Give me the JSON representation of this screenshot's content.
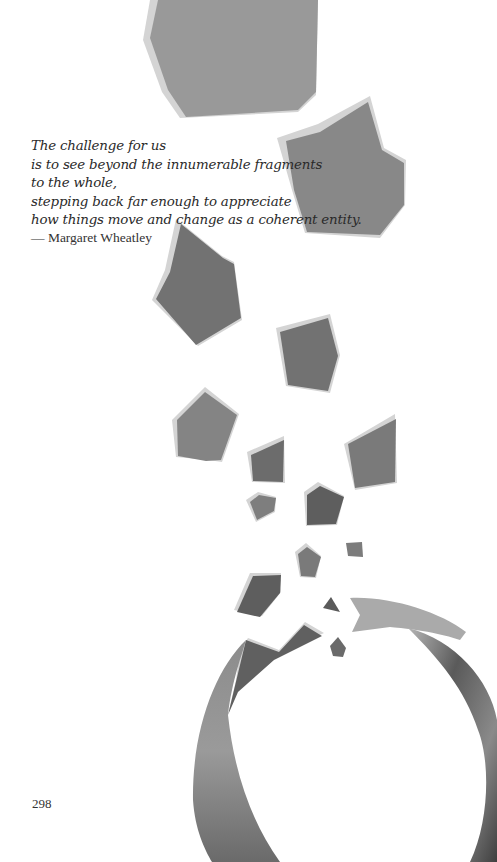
{
  "quote": {
    "lines": [
      "The challenge for us",
      "is to see beyond the innumerable fragments",
      "to the whole,",
      "stepping back far enough to appreciate",
      "how things move and change as a coherent entity."
    ],
    "attribution": "— Margaret Wheatley"
  },
  "page": {
    "number": "298"
  },
  "illustration": {
    "description": "watercolor fragments scattering from a broken ring",
    "colors": {
      "fragment_light": "#9a9a9a",
      "fragment_mid": "#7b7b7b",
      "fragment_dark": "#5f5f5f",
      "edge_highlight": "#d2d2d2"
    }
  }
}
